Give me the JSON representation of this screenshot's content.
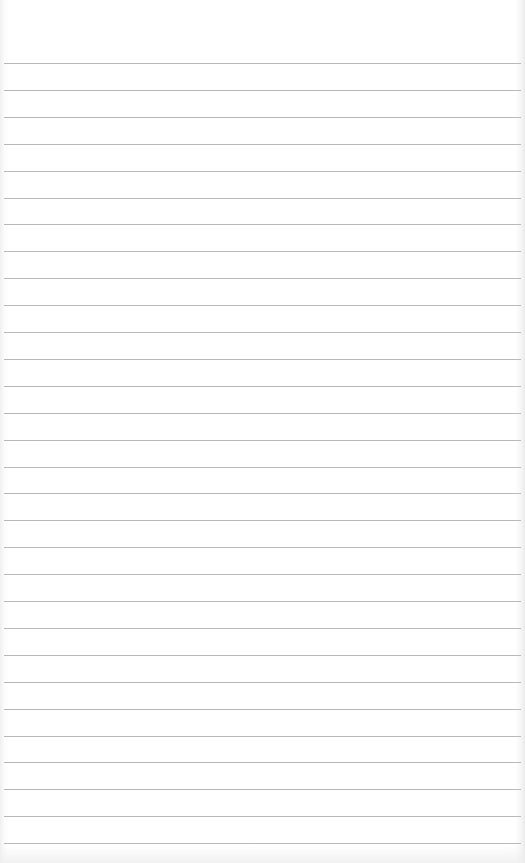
{
  "paper": {
    "type": "lined-notepad-page",
    "background_color": "#ffffff",
    "line_color": "#b9b9b9",
    "line_count": 30,
    "first_line_y": 63,
    "line_spacing_px": 26.9,
    "line_left_x": 4,
    "line_right_x": 521
  },
  "header": {
    "text": ""
  }
}
